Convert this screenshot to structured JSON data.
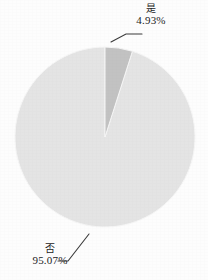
{
  "chart_data": {
    "type": "pie",
    "title": "",
    "subtitle": "",
    "xlabel": "",
    "ylabel": "",
    "legend_position": "none",
    "grid": false,
    "start_angle_deg": 0,
    "direction": "clockwise",
    "categories": [
      "是",
      "否"
    ],
    "values": [
      4.93,
      95.07
    ],
    "units": "percent",
    "slices": [
      {
        "label": "是",
        "value_text": "4.93%",
        "value": 4.93,
        "color": "#c2c2c2",
        "leader_line": true
      },
      {
        "label": "否",
        "value_text": "95.07%",
        "value": 95.07,
        "color": "#e4e4e4",
        "leader_line": true
      }
    ]
  },
  "colors": {
    "background": "#fdfdfd",
    "slice_yes": "#c2c2c2",
    "slice_no": "#e4e4e4",
    "slice_edge": "#f4f4f4",
    "leader_line": "#3a3a3a",
    "text": "#1c1c1c"
  },
  "geometry": {
    "center_x": 105,
    "center_y": 137,
    "radius": 90
  }
}
